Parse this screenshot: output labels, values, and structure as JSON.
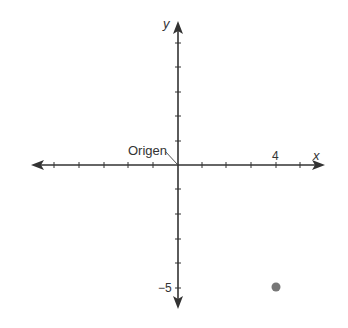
{
  "diagram": {
    "type": "coordinate-plane",
    "origin_label": "Origen",
    "x_axis_label": "x",
    "y_axis_label": "y",
    "x_tick_label": "4",
    "y_tick_label": "−5",
    "x_ticks_positive": [
      1,
      2,
      3,
      4,
      5
    ],
    "x_ticks_negative": [
      -1,
      -2,
      -3,
      -4,
      -5
    ],
    "y_ticks_positive": [
      1,
      2,
      3,
      4,
      5
    ],
    "y_ticks_negative": [
      -1,
      -2,
      -3,
      -4,
      -5
    ],
    "point": {
      "x": 4,
      "y": -5,
      "color": "#777777"
    },
    "axis_color": "#333333"
  }
}
